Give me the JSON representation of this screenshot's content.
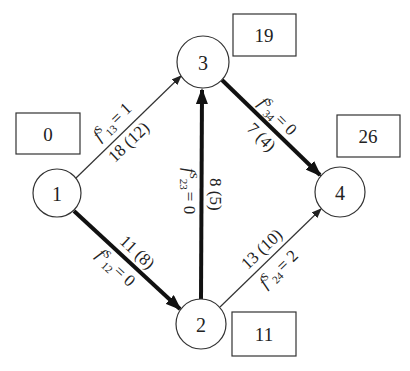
{
  "diagram": {
    "type": "directed-network",
    "nodes": [
      {
        "id": "1",
        "label": "1",
        "cx": 57,
        "cy": 193,
        "r": 24,
        "potential": "0",
        "box": {
          "x": 16,
          "y": 113,
          "w": 64,
          "h": 41
        }
      },
      {
        "id": "2",
        "label": "2",
        "cx": 201,
        "cy": 324,
        "r": 25,
        "potential": "11",
        "box": {
          "x": 232,
          "y": 312,
          "w": 64,
          "h": 44
        }
      },
      {
        "id": "3",
        "label": "3",
        "cx": 203,
        "cy": 62,
        "r": 26,
        "potential": "19",
        "box": {
          "x": 233,
          "y": 14,
          "w": 63,
          "h": 42
        }
      },
      {
        "id": "4",
        "label": "4",
        "cx": 340,
        "cy": 192,
        "r": 25,
        "potential": "26",
        "box": {
          "x": 337,
          "y": 115,
          "w": 63,
          "h": 42
        }
      }
    ],
    "edges": [
      {
        "id": "e13",
        "from": "1",
        "to": "3",
        "weight": "thin",
        "cost_capacity": "18 (12)",
        "flow_label": {
          "f": "f",
          "sup": "S",
          "sub": "13",
          "rest": "= 1"
        }
      },
      {
        "id": "e12",
        "from": "1",
        "to": "2",
        "weight": "thick",
        "cost_capacity": "11 (8)",
        "flow_label": {
          "f": "f",
          "sup": "S",
          "sub": "12",
          "rest": "= 0"
        }
      },
      {
        "id": "e23",
        "from": "2",
        "to": "3",
        "weight": "thick",
        "cost_capacity": "8 (5)",
        "flow_label": {
          "f": "f",
          "sup": "S",
          "sub": "23",
          "rest": "= 0"
        }
      },
      {
        "id": "e34",
        "from": "3",
        "to": "4",
        "weight": "thick",
        "cost_capacity": "7 (4)",
        "flow_label": {
          "f": "f",
          "sup": "S",
          "sub": "34",
          "rest": "= 0"
        }
      },
      {
        "id": "e24",
        "from": "2",
        "to": "4",
        "weight": "thin",
        "cost_capacity": "13 (10)",
        "flow_label": {
          "f": "f",
          "sup": "S",
          "sub": "24",
          "rest": "= 2"
        }
      }
    ]
  }
}
